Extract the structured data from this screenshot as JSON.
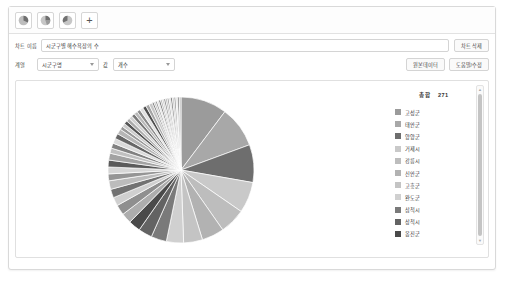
{
  "toolbar": {
    "chart_type_buttons": [
      {
        "name": "pie-chart-type-1",
        "icon": "pie-chart-icon"
      },
      {
        "name": "pie-chart-type-2",
        "icon": "pie-chart-icon"
      },
      {
        "name": "pie-chart-type-3",
        "icon": "pie-chart-icon"
      }
    ],
    "add_label": "+"
  },
  "form": {
    "chart_name_label": "차트 이름",
    "chart_name_value": "시군구별 해수욕장의 수",
    "delete_chart_label": "차트 삭제",
    "series_label": "계열",
    "series_value": "시군구명",
    "value_label": "값",
    "value_value": "개수",
    "action_left_label": "원본데이터",
    "action_right_label": "도움말/수정"
  },
  "legend": {
    "total_label": "총합",
    "total_value": "271"
  },
  "chart_data": {
    "type": "pie",
    "title": "시군구별 해수욕장의 수",
    "total": 271,
    "legend_position": "right",
    "grid": false,
    "categories": [
      "고성군",
      "태안군",
      "양양군",
      "거제시",
      "강릉시",
      "신안군",
      "고흥군",
      "완도군",
      "삼척시",
      "상척시",
      "옹진군"
    ],
    "colors": [
      "#9b9b9b",
      "#a8a8a8",
      "#6e6e6e",
      "#c9c9c9",
      "#bdbdbd",
      "#b2b2b2",
      "#c4c4c4",
      "#d0d0d0",
      "#7a7a7a",
      "#636363",
      "#4a4a4a"
    ],
    "slices": [
      {
        "label": "고성군",
        "value": 27,
        "color": "#9b9b9b"
      },
      {
        "label": "태안군",
        "value": 24,
        "color": "#a8a8a8"
      },
      {
        "label": "양양군",
        "value": 22,
        "color": "#6e6e6e"
      },
      {
        "label": "거제시",
        "value": 18,
        "color": "#c9c9c9"
      },
      {
        "label": "강릉시",
        "value": 15,
        "color": "#bdbdbd"
      },
      {
        "label": "신안군",
        "value": 13,
        "color": "#b2b2b2"
      },
      {
        "label": "고흥군",
        "value": 11,
        "color": "#c4c4c4"
      },
      {
        "label": "완도군",
        "value": 10,
        "color": "#d0d0d0"
      },
      {
        "label": "삼척시",
        "value": 9,
        "color": "#7a7a7a"
      },
      {
        "label": "상척시",
        "value": 8,
        "color": "#636363"
      },
      {
        "label": "옹진군",
        "value": 7,
        "color": "#4a4a4a"
      },
      {
        "label": "기타1",
        "value": 6,
        "color": "#adadad"
      },
      {
        "label": "기타2",
        "value": 6,
        "color": "#8f8f8f"
      },
      {
        "label": "기타3",
        "value": 5,
        "color": "#cfcfcf"
      },
      {
        "label": "기타4",
        "value": 5,
        "color": "#727272"
      },
      {
        "label": "기타5",
        "value": 5,
        "color": "#bcbcbc"
      },
      {
        "label": "기타6",
        "value": 4,
        "color": "#959595"
      },
      {
        "label": "기타7",
        "value": 4,
        "color": "#d6d6d6"
      },
      {
        "label": "기타8",
        "value": 4,
        "color": "#5a5a5a"
      },
      {
        "label": "기타9",
        "value": 4,
        "color": "#a2a2a2"
      },
      {
        "label": "기타10",
        "value": 3,
        "color": "#c0c0c0"
      },
      {
        "label": "기타11",
        "value": 3,
        "color": "#818181"
      },
      {
        "label": "기타12",
        "value": 3,
        "color": "#dadada"
      },
      {
        "label": "기타13",
        "value": 3,
        "color": "#666666"
      },
      {
        "label": "기타14",
        "value": 3,
        "color": "#b6b6b6"
      },
      {
        "label": "기타15",
        "value": 2,
        "color": "#999999"
      },
      {
        "label": "기타16",
        "value": 2,
        "color": "#cccccc"
      },
      {
        "label": "기타17",
        "value": 2,
        "color": "#555555"
      },
      {
        "label": "기타18",
        "value": 2,
        "color": "#aaaaaa"
      },
      {
        "label": "기타19",
        "value": 2,
        "color": "#d3d3d3"
      },
      {
        "label": "기타20",
        "value": 2,
        "color": "#787878"
      },
      {
        "label": "기타21",
        "value": 2,
        "color": "#b9b9b9"
      },
      {
        "label": "기타22",
        "value": 2,
        "color": "#8b8b8b"
      },
      {
        "label": "기타23",
        "value": 2,
        "color": "#e0e0e0"
      },
      {
        "label": "기타24",
        "value": 2,
        "color": "#4f4f4f"
      },
      {
        "label": "기타25",
        "value": 2,
        "color": "#a5a5a5"
      },
      {
        "label": "기타26",
        "value": 2,
        "color": "#c7c7c7"
      },
      {
        "label": "기타27",
        "value": 1,
        "color": "#6b6b6b"
      },
      {
        "label": "기타28",
        "value": 1,
        "color": "#bfbfbf"
      },
      {
        "label": "기타29",
        "value": 1,
        "color": "#909090"
      },
      {
        "label": "기타30",
        "value": 1,
        "color": "#dedede"
      },
      {
        "label": "기타31",
        "value": 1,
        "color": "#5e5e5e"
      },
      {
        "label": "기타32",
        "value": 1,
        "color": "#afafaf"
      },
      {
        "label": "기타33",
        "value": 1,
        "color": "#cacaca"
      },
      {
        "label": "기타34",
        "value": 1,
        "color": "#7e7e7e"
      },
      {
        "label": "기타35",
        "value": 1,
        "color": "#b4b4b4"
      },
      {
        "label": "기타36",
        "value": 1,
        "color": "#989898"
      },
      {
        "label": "기타37",
        "value": 1,
        "color": "#d8d8d8"
      },
      {
        "label": "기타38",
        "value": 1,
        "color": "#686868"
      },
      {
        "label": "기타39",
        "value": 1,
        "color": "#c2c2c2"
      },
      {
        "label": "기타40",
        "value": 1,
        "color": "#868686"
      },
      {
        "label": "기타41",
        "value": 1,
        "color": "#e3e3e3"
      },
      {
        "label": "기타42",
        "value": 1,
        "color": "#767676"
      },
      {
        "label": "기타43",
        "value": 1,
        "color": "#bbbbbb"
      }
    ]
  },
  "scrollbar": {
    "up_arrow": "▲",
    "down_arrow": "▼"
  }
}
